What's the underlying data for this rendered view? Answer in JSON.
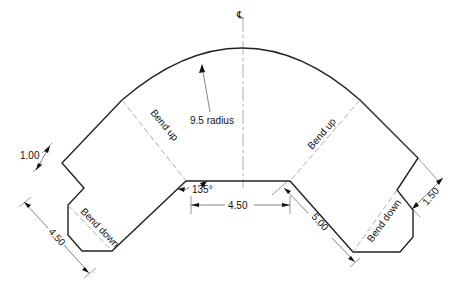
{
  "drawing": {
    "centerline_symbol": "℄",
    "radius_label": "9.5 radius",
    "angle_label": "135°",
    "bend_labels": {
      "left_up": "Bend up",
      "right_up": "Bend up",
      "left_down": "Bend down",
      "right_down": "Bend down"
    },
    "dimensions": {
      "left_flange": "1.00",
      "left_length": "4.50",
      "bottom_width": "4.50",
      "right_length": "5.00",
      "right_flange": "1.50"
    },
    "colors": {
      "outline": "#222222",
      "bend_line": "#999999",
      "dimension": "#333333"
    }
  }
}
